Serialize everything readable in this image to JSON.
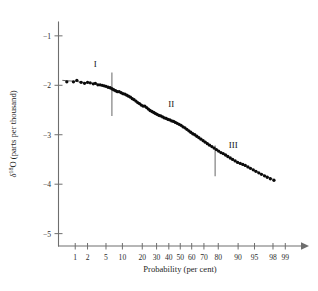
{
  "chart_data": {
    "type": "scatter",
    "title": "",
    "subtitle": "",
    "xlabel": "Probability (per cent)",
    "ylabel": "δ 18O (parts per thousand)",
    "ylabel_parts": {
      "delta": "δ",
      "superscript": "18",
      "element": "O",
      "units": "(parts per thousand)"
    },
    "x_scale": "probability",
    "xlim": [
      0.35,
      99.6
    ],
    "ylim": [
      -5.25,
      -0.72
    ],
    "grid": false,
    "legend": "none",
    "x_tick_labels": [
      "1",
      "2",
      "5",
      "10",
      "20",
      "30",
      "40",
      "50",
      "60",
      "70",
      "80",
      "90",
      "95",
      "98",
      "99"
    ],
    "x_tick_values": [
      1,
      2,
      5,
      10,
      20,
      30,
      40,
      50,
      60,
      70,
      80,
      90,
      95,
      98,
      99
    ],
    "y_tick_labels": [
      "−1",
      "−2",
      "−3",
      "−4",
      "−5"
    ],
    "y_tick_values": [
      -1,
      -2,
      -3,
      -4,
      -5
    ],
    "annotations": [
      {
        "text": "I",
        "x_percent": 3.0,
        "y_value": -1.62
      },
      {
        "text": "II",
        "x_percent": 42.0,
        "y_value": -2.44
      },
      {
        "text": "III",
        "x_percent": 88.0,
        "y_value": -3.26
      }
    ],
    "dividers": [
      {
        "x_percent": 6.5,
        "y_top": -1.74,
        "y_bottom": -2.62
      },
      {
        "x_percent": 78.0,
        "y_top": -3.22,
        "y_bottom": -3.84
      }
    ],
    "series": [
      {
        "name": "δ18O measurements",
        "marker": "filled-circle",
        "color": "#0b0b0b",
        "points": [
          [
            0.6,
            -1.93
          ],
          [
            0.9,
            -1.93
          ],
          [
            1.1,
            -1.9
          ],
          [
            1.4,
            -1.94
          ],
          [
            1.7,
            -1.96
          ],
          [
            2.0,
            -1.94
          ],
          [
            2.3,
            -1.95
          ],
          [
            2.7,
            -1.97
          ],
          [
            3.0,
            -1.96
          ],
          [
            3.4,
            -1.99
          ],
          [
            3.8,
            -1.99
          ],
          [
            4.2,
            -2.0
          ],
          [
            4.6,
            -2.01
          ],
          [
            5.0,
            -2.02
          ],
          [
            5.5,
            -2.04
          ],
          [
            6.0,
            -2.05
          ],
          [
            6.5,
            -2.07
          ],
          [
            7.0,
            -2.09
          ],
          [
            7.6,
            -2.11
          ],
          [
            8.2,
            -2.13
          ],
          [
            8.8,
            -2.13
          ],
          [
            9.5,
            -2.15
          ],
          [
            10.2,
            -2.17
          ],
          [
            11.0,
            -2.18
          ],
          [
            11.8,
            -2.2
          ],
          [
            12.6,
            -2.22
          ],
          [
            13.5,
            -2.24
          ],
          [
            14.4,
            -2.27
          ],
          [
            15.3,
            -2.29
          ],
          [
            16.3,
            -2.32
          ],
          [
            17.3,
            -2.35
          ],
          [
            18.3,
            -2.37
          ],
          [
            19.4,
            -2.4
          ],
          [
            20.5,
            -2.42
          ],
          [
            21.6,
            -2.42
          ],
          [
            22.8,
            -2.45
          ],
          [
            24.0,
            -2.48
          ],
          [
            25.2,
            -2.51
          ],
          [
            26.5,
            -2.53
          ],
          [
            27.8,
            -2.55
          ],
          [
            29.1,
            -2.57
          ],
          [
            30.5,
            -2.59
          ],
          [
            31.9,
            -2.61
          ],
          [
            33.3,
            -2.62
          ],
          [
            34.8,
            -2.64
          ],
          [
            36.3,
            -2.66
          ],
          [
            37.8,
            -2.67
          ],
          [
            39.3,
            -2.69
          ],
          [
            40.9,
            -2.7
          ],
          [
            42.5,
            -2.72
          ],
          [
            44.1,
            -2.73
          ],
          [
            45.7,
            -2.75
          ],
          [
            47.3,
            -2.77
          ],
          [
            49.0,
            -2.79
          ],
          [
            50.7,
            -2.81
          ],
          [
            52.4,
            -2.84
          ],
          [
            54.1,
            -2.86
          ],
          [
            55.8,
            -2.89
          ],
          [
            57.5,
            -2.92
          ],
          [
            59.2,
            -2.95
          ],
          [
            60.9,
            -2.98
          ],
          [
            62.6,
            -3.0
          ],
          [
            64.3,
            -3.03
          ],
          [
            66.0,
            -3.06
          ],
          [
            67.7,
            -3.09
          ],
          [
            69.4,
            -3.12
          ],
          [
            71.0,
            -3.15
          ],
          [
            72.6,
            -3.18
          ],
          [
            74.2,
            -3.21
          ],
          [
            75.8,
            -3.24
          ],
          [
            77.3,
            -3.27
          ],
          [
            78.8,
            -3.3
          ],
          [
            80.2,
            -3.33
          ],
          [
            81.6,
            -3.36
          ],
          [
            82.9,
            -3.38
          ],
          [
            84.2,
            -3.41
          ],
          [
            85.4,
            -3.44
          ],
          [
            86.6,
            -3.47
          ],
          [
            87.7,
            -3.5
          ],
          [
            88.8,
            -3.53
          ],
          [
            89.8,
            -3.56
          ],
          [
            90.8,
            -3.58
          ],
          [
            91.7,
            -3.6
          ],
          [
            92.5,
            -3.62
          ],
          [
            93.3,
            -3.65
          ],
          [
            94.0,
            -3.68
          ],
          [
            94.7,
            -3.71
          ],
          [
            95.3,
            -3.74
          ],
          [
            95.9,
            -3.77
          ],
          [
            96.4,
            -3.8
          ],
          [
            96.9,
            -3.83
          ],
          [
            97.3,
            -3.86
          ],
          [
            97.7,
            -3.89
          ],
          [
            98.1,
            -3.92
          ]
        ]
      }
    ],
    "fit_line": {
      "name": "fitted-curve",
      "points": [
        [
          0.45,
          -1.9
        ],
        [
          1.0,
          -1.92
        ],
        [
          2.0,
          -1.95
        ],
        [
          3.5,
          -1.98
        ],
        [
          5.0,
          -2.02
        ],
        [
          7.0,
          -2.08
        ],
        [
          9.0,
          -2.14
        ],
        [
          12.0,
          -2.21
        ],
        [
          16.0,
          -2.31
        ],
        [
          20.0,
          -2.4
        ],
        [
          25.0,
          -2.5
        ],
        [
          30.0,
          -2.58
        ],
        [
          35.0,
          -2.64
        ],
        [
          40.0,
          -2.7
        ],
        [
          45.0,
          -2.74
        ],
        [
          50.0,
          -2.79
        ],
        [
          55.0,
          -2.87
        ],
        [
          60.0,
          -2.96
        ],
        [
          65.0,
          -3.04
        ],
        [
          70.0,
          -3.13
        ],
        [
          75.0,
          -3.22
        ],
        [
          80.0,
          -3.33
        ],
        [
          85.0,
          -3.43
        ],
        [
          90.0,
          -3.57
        ],
        [
          94.0,
          -3.68
        ],
        [
          96.5,
          -3.8
        ],
        [
          98.2,
          -3.92
        ]
      ]
    }
  }
}
